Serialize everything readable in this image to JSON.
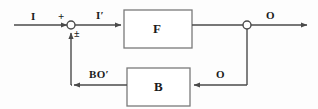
{
  "diagram": {
    "type": "feedback-control-block-diagram",
    "background_color": "#fdfdfd",
    "line_color": "#4a4a4a",
    "text_color": "#1b1b1b",
    "signals": {
      "input": "I",
      "sum_sign_top": "+",
      "sum_sign_bottom": "±",
      "error": "I′",
      "output": "O",
      "feedback_tap": "O",
      "feedback_signal": "BO′"
    },
    "blocks": [
      {
        "id": "forward",
        "label": "F",
        "x": 124,
        "y": 10,
        "width": 68,
        "height": 38
      },
      {
        "id": "feedback",
        "label": "B",
        "x": 127,
        "y": 68,
        "width": 63,
        "height": 38
      }
    ],
    "nodes": [
      {
        "id": "summing-junction",
        "x": 71,
        "y": 25,
        "radius": 4
      },
      {
        "id": "output-takeoff-node",
        "x": 247,
        "y": 25,
        "radius": 4
      }
    ]
  }
}
